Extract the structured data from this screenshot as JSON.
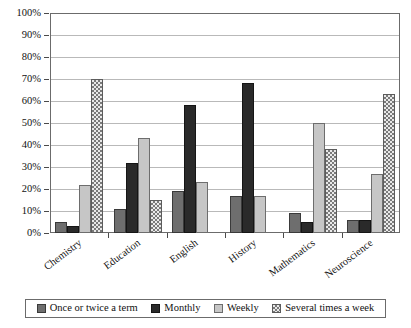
{
  "chart_data": {
    "type": "bar",
    "title": "",
    "xlabel": "",
    "ylabel": "",
    "ylim": [
      0,
      100
    ],
    "grid": true,
    "legend_position": "bottom",
    "categories": [
      "Chemistry",
      "Education",
      "English",
      "History",
      "Mathematics",
      "Neuroscience"
    ],
    "y_ticks": [
      "0%",
      "10%",
      "20%",
      "30%",
      "40%",
      "50%",
      "60%",
      "70%",
      "80%",
      "90%",
      "100%"
    ],
    "y_tick_values": [
      0,
      10,
      20,
      30,
      40,
      50,
      60,
      70,
      80,
      90,
      100
    ],
    "series": [
      {
        "name": "Once or twice a term",
        "color": "#6e6e6e",
        "pattern": "solid",
        "values": [
          5,
          11,
          19,
          17,
          9,
          6
        ]
      },
      {
        "name": "Monthly",
        "color": "#2a2a2a",
        "pattern": "solid",
        "values": [
          3,
          32,
          58,
          68,
          5,
          6
        ]
      },
      {
        "name": "Weekly",
        "color": "#c6c6c6",
        "pattern": "solid",
        "values": [
          22,
          43,
          23,
          17,
          50,
          27
        ]
      },
      {
        "name": "Several times a week",
        "color": "#e9e9e9",
        "pattern": "checker",
        "values": [
          70,
          15,
          0,
          0,
          38,
          63
        ]
      }
    ]
  },
  "legend": {
    "items": [
      {
        "label": "Once or twice a term"
      },
      {
        "label": "Monthly"
      },
      {
        "label": "Weekly"
      },
      {
        "label": "Several times a week"
      }
    ]
  }
}
